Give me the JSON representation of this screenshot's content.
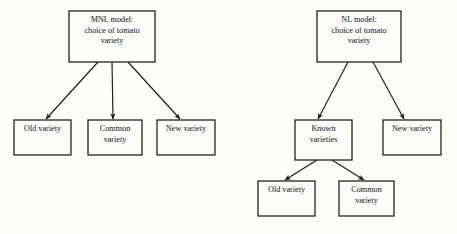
{
  "figure": {
    "type": "diagram",
    "subtype": "tree-diagram",
    "background_color": "#fdfdfc",
    "line_color": "#1a1a1a",
    "box_fill": "#fdfdfc",
    "panels": [
      {
        "id": "mnl",
        "name": "mnl-tree",
        "root": {
          "id": "mnl-root",
          "name": "mnl-root-node",
          "lines": [
            "MNL model:",
            "choice of tomato",
            "variety"
          ],
          "x": 69,
          "y": 11,
          "w": 86,
          "h": 51
        },
        "children": [
          {
            "id": "mnl-old",
            "name": "mnl-old-variety-node",
            "lines": [
              "Old variety"
            ],
            "x": 14,
            "y": 120,
            "w": 57,
            "h": 35,
            "from_x": 98,
            "from_y": 62,
            "to_x": 46,
            "to_y": 119
          },
          {
            "id": "mnl-common",
            "name": "mnl-common-variety-node",
            "lines": [
              "Common",
              "variety"
            ],
            "x": 88,
            "y": 120,
            "w": 54,
            "h": 35,
            "from_x": 112,
            "from_y": 62,
            "to_x": 113,
            "to_y": 119
          },
          {
            "id": "mnl-new",
            "name": "mnl-new-variety-node",
            "lines": [
              "New variety"
            ],
            "x": 157,
            "y": 120,
            "w": 58,
            "h": 35,
            "from_x": 128,
            "from_y": 62,
            "to_x": 180,
            "to_y": 119
          }
        ]
      },
      {
        "id": "nl",
        "name": "nl-tree",
        "root": {
          "id": "nl-root",
          "name": "nl-root-node",
          "lines": [
            "NL model:",
            "choice of tomato",
            "variety"
          ],
          "x": 317,
          "y": 11,
          "w": 84,
          "h": 51
        },
        "children": [
          {
            "id": "nl-known",
            "name": "nl-known-varieties-node",
            "lines": [
              "Known",
              "varieties"
            ],
            "x": 295,
            "y": 120,
            "w": 57,
            "h": 40,
            "from_x": 348,
            "from_y": 62,
            "to_x": 318,
            "to_y": 119
          },
          {
            "id": "nl-new",
            "name": "nl-new-variety-node",
            "lines": [
              "New variety"
            ],
            "x": 383,
            "y": 120,
            "w": 58,
            "h": 35,
            "from_x": 373,
            "from_y": 62,
            "to_x": 404,
            "to_y": 119
          }
        ],
        "grandchildren": [
          {
            "id": "nl-old",
            "name": "nl-old-variety-node",
            "lines": [
              "Old variety"
            ],
            "x": 258,
            "y": 181,
            "w": 57,
            "h": 35,
            "from_x": 317,
            "from_y": 160,
            "to_x": 285,
            "to_y": 180
          },
          {
            "id": "nl-common",
            "name": "nl-common-variety-node",
            "lines": [
              "Common",
              "variety"
            ],
            "x": 339,
            "y": 181,
            "w": 55,
            "h": 35,
            "from_x": 332,
            "from_y": 160,
            "to_x": 364,
            "to_y": 180
          }
        ]
      }
    ]
  }
}
